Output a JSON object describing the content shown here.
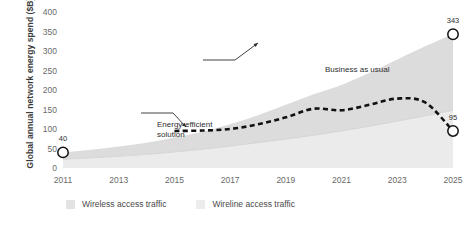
{
  "chart_data": {
    "type": "area",
    "title": "",
    "xlabel": "",
    "ylabel": "Global annual network energy spend ($B)",
    "xlim": [
      2011,
      2025
    ],
    "ylim": [
      0,
      400
    ],
    "ytick_labels": [
      "0",
      "50",
      "100",
      "150",
      "200",
      "250",
      "300",
      "350",
      "400"
    ],
    "ytick_values": [
      0,
      50,
      100,
      150,
      200,
      250,
      300,
      350,
      400
    ],
    "xtick_labels": [
      "2011",
      "2013",
      "2015",
      "2017",
      "2019",
      "2021",
      "2023",
      "2025"
    ],
    "xtick_values": [
      2011,
      2013,
      2015,
      2017,
      2019,
      2021,
      2023,
      2025
    ],
    "grid": false,
    "legend_position": "bottom-left",
    "stacked": true,
    "x": [
      2011,
      2012,
      2013,
      2014,
      2015,
      2016,
      2017,
      2018,
      2019,
      2020,
      2021,
      2022,
      2023,
      2024,
      2025
    ],
    "series": [
      {
        "name": "Wireline access traffic",
        "kind": "area",
        "color": "#ebebeb",
        "values": [
          22,
          26,
          30,
          35,
          41,
          48,
          56,
          65,
          74,
          84,
          95,
          107,
          120,
          134,
          148
        ]
      },
      {
        "name": "Wireless access traffic",
        "kind": "area",
        "color": "#dcdcdc",
        "values": [
          18,
          21,
          25,
          30,
          37,
          45,
          56,
          70,
          88,
          105,
          118,
          137,
          158,
          178,
          195
        ]
      },
      {
        "name": "Business as usual",
        "kind": "total-boundary",
        "color": "#c9c9c9",
        "values": [
          40,
          47,
          55,
          65,
          78,
          93,
          112,
          135,
          162,
          189,
          213,
          244,
          278,
          312,
          343
        ]
      },
      {
        "name": "Energy-efficient solution",
        "kind": "dashed-line",
        "color": "#111111",
        "x": [
          2015,
          2016,
          2017,
          2018,
          2019,
          2020,
          2021,
          2022,
          2023,
          2024,
          2025
        ],
        "values": [
          95,
          96,
          100,
          112,
          130,
          152,
          148,
          162,
          178,
          168,
          95
        ]
      }
    ],
    "markers": [
      {
        "name": "start-marker",
        "x": 2011,
        "value": 40,
        "label": "40"
      },
      {
        "name": "business-as-usual-end-marker",
        "x": 2025,
        "value": 343,
        "label": "343"
      },
      {
        "name": "energy-efficient-end-marker",
        "x": 2025,
        "value": 95,
        "label": "95"
      }
    ],
    "annotations": [
      {
        "name": "energy-efficient-solution",
        "text": "Energy-efficient\nsolution"
      },
      {
        "name": "business-as-usual",
        "text": "Business as usual"
      }
    ]
  },
  "legend": {
    "items": [
      {
        "label": "Wireless access traffic",
        "color": "#e3e3e3"
      },
      {
        "label": "Wireline access traffic",
        "color": "#ececec"
      }
    ]
  },
  "colors": {
    "wireless_band": "#dcdcdc",
    "wireline_band": "#ebebeb",
    "dashed_line": "#111111",
    "text": "#2e2e2e",
    "tick_text": "#6a6a6a"
  }
}
